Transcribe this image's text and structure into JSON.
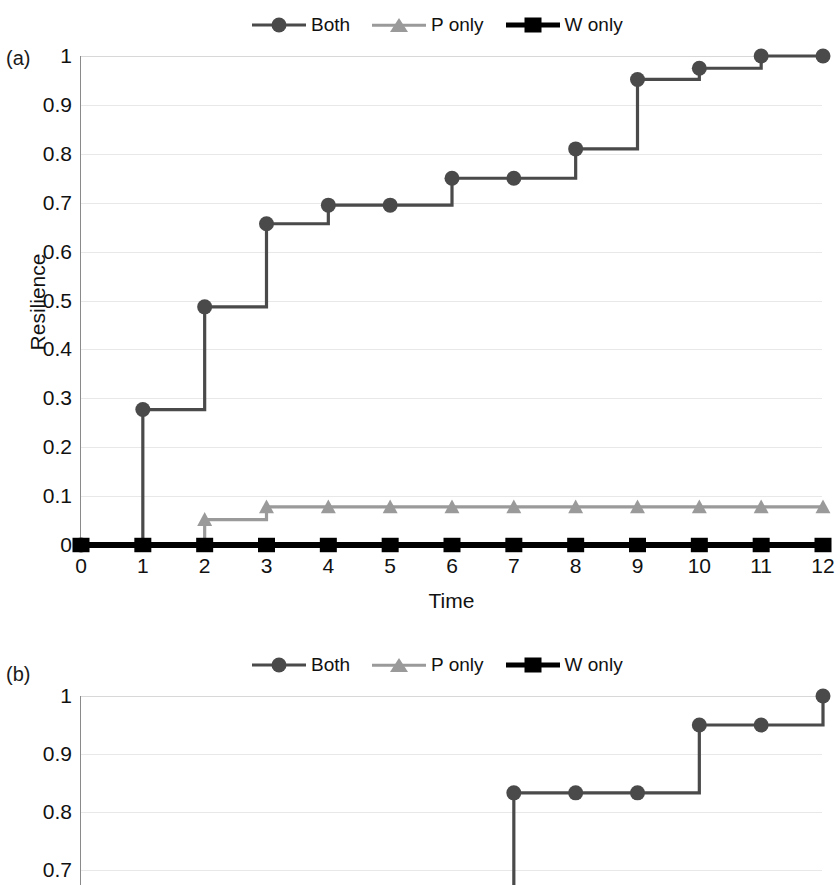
{
  "figure": {
    "panels": [
      {
        "tag": "(a)",
        "legend": [
          {
            "label": "Both",
            "marker": "circle-marker",
            "color": "#4a4a4a"
          },
          {
            "label": "P only",
            "marker": "triangle-marker",
            "color": "#9a9a9a"
          },
          {
            "label": "W only",
            "marker": "square-marker",
            "color": "#000000"
          }
        ],
        "xlabel": "Time",
        "ylabel": "Resilience",
        "yticks": [
          "0",
          "0.1",
          "0.2",
          "0.3",
          "0.4",
          "0.5",
          "0.6",
          "0.7",
          "0.8",
          "0.9",
          "1"
        ],
        "xticks": [
          "0",
          "1",
          "2",
          "3",
          "4",
          "5",
          "6",
          "7",
          "8",
          "9",
          "10",
          "11",
          "12"
        ]
      },
      {
        "tag": "(b)",
        "legend": [
          {
            "label": "Both",
            "marker": "circle-marker",
            "color": "#4a4a4a"
          },
          {
            "label": "P only",
            "marker": "triangle-marker",
            "color": "#9a9a9a"
          },
          {
            "label": "W only",
            "marker": "square-marker",
            "color": "#000000"
          }
        ],
        "xlabel": "",
        "ylabel": "",
        "yticks": [
          "0.7",
          "0.8",
          "0.9",
          "1"
        ],
        "xticks": []
      }
    ]
  },
  "chart_data": [
    {
      "type": "line",
      "subplot": "(a)",
      "title": "",
      "xlabel": "Time",
      "ylabel": "Resilience",
      "xlim": [
        0,
        12
      ],
      "ylim": [
        0,
        1
      ],
      "xticks": [
        0,
        1,
        2,
        3,
        4,
        5,
        6,
        7,
        8,
        9,
        10,
        11,
        12
      ],
      "yticks": [
        0,
        0.1,
        0.2,
        0.3,
        0.4,
        0.5,
        0.6,
        0.7,
        0.8,
        0.9,
        1
      ],
      "grid": "horizontal",
      "step": "post",
      "legend_position": "top-center",
      "x": [
        0,
        1,
        2,
        3,
        4,
        5,
        6,
        7,
        8,
        9,
        10,
        11,
        12
      ],
      "series": [
        {
          "name": "Both",
          "marker": "circle",
          "color": "#4a4a4a",
          "values": [
            0,
            0.277,
            0.487,
            0.657,
            0.695,
            0.695,
            0.75,
            0.75,
            0.81,
            0.952,
            0.975,
            1,
            1
          ],
          "step_values_after_rise": [
            0,
            0.277,
            0.487,
            0.657,
            0.695,
            0.695,
            0.75,
            0.75,
            0.81,
            0.952,
            0.975,
            1,
            1
          ]
        },
        {
          "name": "P only",
          "marker": "triangle",
          "color": "#9a9a9a",
          "values": [
            0,
            0,
            0.052,
            0.078,
            0.078,
            0.078,
            0.078,
            0.078,
            0.078,
            0.078,
            0.078,
            0.078,
            0.078
          ]
        },
        {
          "name": "W only",
          "marker": "square",
          "color": "#000000",
          "values": [
            0,
            0,
            0,
            0,
            0,
            0,
            0,
            0,
            0,
            0,
            0,
            0,
            0
          ]
        }
      ]
    },
    {
      "type": "line",
      "subplot": "(b)",
      "title": "",
      "xlabel": "",
      "ylabel": "",
      "xlim": [
        0,
        12
      ],
      "ylim": [
        0.6,
        1
      ],
      "yticks": [
        0.7,
        0.8,
        0.9,
        1
      ],
      "grid": "horizontal",
      "step": "post",
      "legend_position": "top-center",
      "note": "panel cropped at bottom of image",
      "x": [
        7,
        8,
        9,
        10,
        11,
        12
      ],
      "series": [
        {
          "name": "Both",
          "marker": "circle",
          "color": "#4a4a4a",
          "values": [
            0.833,
            0.833,
            0.833,
            0.95,
            0.95,
            1.0
          ],
          "visible_points_x": [
            7,
            8,
            9,
            10,
            11,
            12
          ]
        }
      ]
    }
  ]
}
